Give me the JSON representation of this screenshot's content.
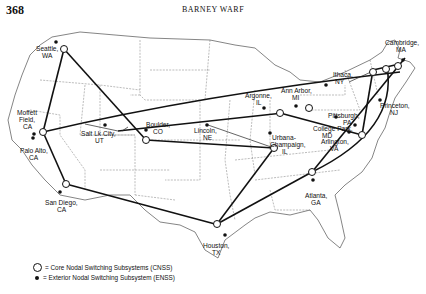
{
  "header": {
    "page_number": "368",
    "running_head": "BARNEY WARF"
  },
  "legend": {
    "core": "= Core Nodal Switching Subsystems (CNSS)",
    "exterior": "= Exterior Nodal Switching Subsystem (ENSS)"
  },
  "map": {
    "title": "NSFNET backbone nodes",
    "labels": [
      {
        "id": "seattle",
        "line1": "Seattle,",
        "line2": "WA"
      },
      {
        "id": "moffett",
        "line1": "Moffett",
        "line2": "Field,",
        "line3": "CA"
      },
      {
        "id": "paloalto",
        "line1": "Palo Alto,",
        "line2": "CA"
      },
      {
        "id": "sandiego",
        "line1": "San Diego,",
        "line2": "CA"
      },
      {
        "id": "saltlake",
        "line1": "Salt Lk City,",
        "line2": "UT"
      },
      {
        "id": "boulder",
        "line1": "Boulder,",
        "line2": "CO"
      },
      {
        "id": "lincoln",
        "line1": "Lincoln,",
        "line2": "NE"
      },
      {
        "id": "houston",
        "line1": "Houston,",
        "line2": "TX"
      },
      {
        "id": "argonne",
        "line1": "Argonne,",
        "line2": "IL"
      },
      {
        "id": "urbana",
        "line1": "Urbana-",
        "line2": "Champaign,",
        "line3": "IL"
      },
      {
        "id": "annarbor",
        "line1": "Ann Arbor,",
        "line2": "MI"
      },
      {
        "id": "ithaca",
        "line1": "Ithaca,",
        "line2": "NY"
      },
      {
        "id": "cambridge",
        "line1": "Cambridge,",
        "line2": "MA"
      },
      {
        "id": "princeton",
        "line1": "Princeton,",
        "line2": "NJ"
      },
      {
        "id": "pittsburgh",
        "line1": "Pittsburgh,",
        "line2": "PA"
      },
      {
        "id": "collegepark",
        "line1": "College Park,",
        "line2": "MD"
      },
      {
        "id": "arlington",
        "line1": "Arlington,",
        "line2": "VA"
      },
      {
        "id": "atlanta",
        "line1": "Atlanta,",
        "line2": "GA"
      }
    ]
  }
}
